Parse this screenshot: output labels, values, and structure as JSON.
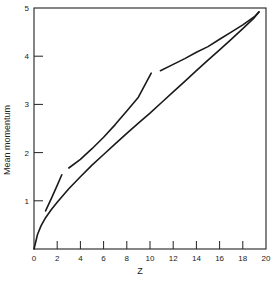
{
  "chart_data": {
    "type": "line",
    "title": "",
    "xlabel": "Z",
    "ylabel": "Mean momentum",
    "xlim": [
      0,
      20
    ],
    "ylim": [
      0,
      5
    ],
    "grid": false,
    "legend": null,
    "x_ticks": [
      0,
      2,
      4,
      6,
      8,
      10,
      12,
      14,
      16,
      18,
      20
    ],
    "y_ticks": [
      1,
      2,
      3,
      4,
      5
    ],
    "series": [
      {
        "name": "main curve",
        "x": [
          0,
          0.3,
          0.6,
          1,
          1.5,
          2,
          3,
          4,
          5,
          6,
          7,
          8,
          9,
          10,
          11,
          12,
          13,
          14,
          15,
          16,
          17,
          18,
          19,
          19.4
        ],
        "y": [
          0,
          0.3,
          0.48,
          0.65,
          0.82,
          0.97,
          1.25,
          1.5,
          1.74,
          1.96,
          2.18,
          2.4,
          2.61,
          2.82,
          3.04,
          3.26,
          3.48,
          3.7,
          3.92,
          4.13,
          4.35,
          4.57,
          4.8,
          4.92
        ]
      },
      {
        "name": "segment 1",
        "x": [
          1.0,
          1.5,
          2.0,
          2.4
        ],
        "y": [
          0.79,
          1.05,
          1.32,
          1.54
        ]
      },
      {
        "name": "segment 2",
        "x": [
          3.0,
          4,
          5,
          6,
          7,
          8,
          9,
          10.1
        ],
        "y": [
          1.68,
          1.86,
          2.08,
          2.32,
          2.58,
          2.86,
          3.15,
          3.65
        ]
      },
      {
        "name": "segment 3",
        "x": [
          10.9,
          12,
          13,
          14,
          15,
          16,
          17,
          18,
          19,
          19.4
        ],
        "y": [
          3.7,
          3.83,
          3.95,
          4.08,
          4.2,
          4.35,
          4.5,
          4.65,
          4.82,
          4.92
        ]
      }
    ]
  },
  "axes": {
    "x_label": "Z",
    "y_label": "Mean momentum"
  }
}
